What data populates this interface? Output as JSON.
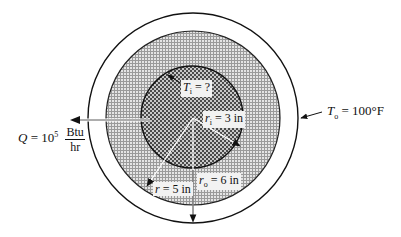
{
  "figure": {
    "type": "concentric-cylinder-heat-conduction",
    "colors": {
      "background": "#ffffff",
      "inner_core": "#8a8a8a",
      "insulation_layer": "#c8c8c8",
      "outer_gap": "#ffffff",
      "lines": "#111111"
    },
    "circles": [
      {
        "name": "outer-boundary",
        "cx": 193,
        "cy": 118,
        "r": 105
      },
      {
        "name": "insulation-layer",
        "cx": 193,
        "cy": 118,
        "r": 87
      },
      {
        "name": "inner-core",
        "cx": 192,
        "cy": 117,
        "r": 51
      }
    ]
  },
  "labels": {
    "inner_temp": {
      "symbol": "T",
      "subscript": "i",
      "text": " = ?"
    },
    "inner_radius": {
      "symbol": "r",
      "subscript": "i",
      "text": " = 3 in"
    },
    "radius": {
      "symbol": "r",
      "text": " = 5 in"
    },
    "outer_radius": {
      "symbol": "r",
      "subscript": "o",
      "text": " = 6 in"
    },
    "outer_temp": {
      "symbol": "T",
      "subscript": "o",
      "text": " = 100°F"
    },
    "heat_rate": {
      "symbol": "Q",
      "text": " = 10",
      "exponent": "5",
      "unit_numerator": "Btu",
      "unit_denominator": "hr"
    }
  }
}
